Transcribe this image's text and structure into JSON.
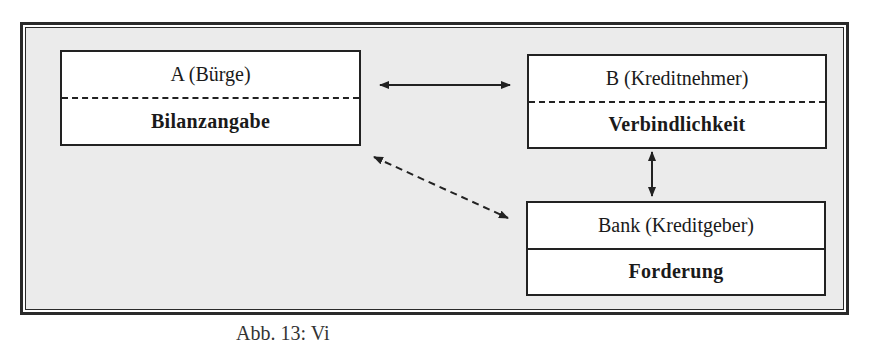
{
  "diagram": {
    "boxes": [
      {
        "id": "a",
        "header": "A (Bürge)",
        "body": "Bilanzangabe",
        "divider": "dashed"
      },
      {
        "id": "b",
        "header": "B (Kreditnehmer)",
        "body": "Verbindlichkeit",
        "divider": "dashed"
      },
      {
        "id": "bank",
        "header": "Bank (Kreditgeber)",
        "body": "Forderung",
        "divider": "solid"
      }
    ],
    "connections": [
      {
        "from": "a",
        "to": "b",
        "style": "solid",
        "direction": "bidirectional"
      },
      {
        "from": "b",
        "to": "bank",
        "style": "solid",
        "direction": "bidirectional"
      },
      {
        "from": "a",
        "to": "bank",
        "style": "dashed",
        "direction": "bidirectional"
      }
    ],
    "caption": "Abb. 13: Vi"
  },
  "colors": {
    "frame_background": "#ebebeb",
    "box_background": "#ffffff",
    "line": "#222222"
  }
}
